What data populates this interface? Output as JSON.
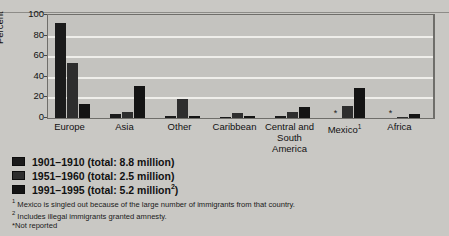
{
  "chart_data": {
    "type": "bar",
    "title": "",
    "xlabel": "",
    "ylabel": "Percent",
    "ylim": [
      0,
      100
    ],
    "yticks": [
      0,
      20,
      40,
      60,
      80,
      100
    ],
    "grid": true,
    "legend_position": "below-left",
    "categories": [
      "Europe",
      "Asia",
      "Other",
      "Caribbean",
      "Central and South America",
      "Mexico",
      "Africa"
    ],
    "series": [
      {
        "name": "1901–1910 (total: 8.8 million)",
        "values": [
          92,
          4,
          2,
          1,
          2,
          null,
          null
        ]
      },
      {
        "name": "1951–1960 (total: 2.5 million)",
        "values": [
          53,
          6,
          18,
          5,
          6,
          12,
          1
        ]
      },
      {
        "name": "1991–1995 (total: 5.2 million²)",
        "values": [
          14,
          31,
          2,
          2,
          11,
          29,
          4
        ]
      }
    ],
    "not_reported_marker": "*",
    "not_reported_cells": [
      {
        "category": "Mexico",
        "series": "1901–1910 (total: 8.8 million)"
      },
      {
        "category": "Africa",
        "series": "1901–1910 (total: 8.8 million)"
      }
    ]
  },
  "axis": {
    "y_label": "Percent",
    "y_ticks": [
      "100",
      "80",
      "60",
      "40",
      "20",
      "0"
    ]
  },
  "x_labels": [
    {
      "text": "Europe",
      "sup": ""
    },
    {
      "text": "Asia",
      "sup": ""
    },
    {
      "text": "Other",
      "sup": ""
    },
    {
      "text": "Caribbean",
      "sup": ""
    },
    {
      "text": "Central and South America",
      "sup": ""
    },
    {
      "text": "Mexico",
      "sup": "1"
    },
    {
      "text": "Africa",
      "sup": ""
    }
  ],
  "legend": {
    "items": [
      {
        "label": "1901–1910 (total: 8.8 million)",
        "sup": ""
      },
      {
        "label": "1951–1960 (total: 2.5 million)",
        "sup": ""
      },
      {
        "label": "1991–1995 (total: 5.2 million",
        "sup": "2",
        "tail": ")"
      }
    ]
  },
  "footnotes": [
    {
      "marker": "1",
      "text": "Mexico is singled out because of the large number of immigrants from that country."
    },
    {
      "marker": "2",
      "text": "Includes illegal immigrants granted amnesty."
    },
    {
      "marker": "*",
      "text": "Not reported"
    }
  ],
  "colors": {
    "page_background": "#c9c8c4",
    "plot_background": "#c4c3bf",
    "gridline": "#efeeea",
    "bar_series_1": "#1b1b1b",
    "bar_series_2": "#2e2e2e",
    "bar_series_3": "#141414",
    "axis": "#6f6e6a",
    "text": "#111111"
  }
}
